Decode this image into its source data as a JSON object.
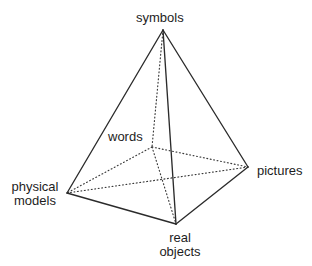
{
  "figure": {
    "background_color": "#ffffff",
    "line_color": "#2b2b2b",
    "text_color": "#1d1d1d",
    "width": 312,
    "height": 266
  },
  "vertices": {
    "symbols": {
      "label": "symbols",
      "x": 163,
      "y": 30,
      "hidden": false
    },
    "words": {
      "label": "words",
      "x": 152,
      "y": 147,
      "hidden": true
    },
    "pictures": {
      "label": "pictures",
      "x": 248,
      "y": 167,
      "hidden": false
    },
    "physical_models": {
      "label_line1": "physical",
      "label_line2": "models",
      "x": 67,
      "y": 193,
      "hidden": false
    },
    "real_objects": {
      "label_line1": "real",
      "label_line2": "objects",
      "x": 176,
      "y": 224,
      "hidden": false
    }
  },
  "edges": [
    {
      "from": "symbols",
      "to": "physical_models",
      "style": "solid"
    },
    {
      "from": "symbols",
      "to": "pictures",
      "style": "solid"
    },
    {
      "from": "symbols",
      "to": "real_objects",
      "style": "solid"
    },
    {
      "from": "physical_models",
      "to": "real_objects",
      "style": "solid"
    },
    {
      "from": "real_objects",
      "to": "pictures",
      "style": "solid"
    },
    {
      "from": "symbols",
      "to": "words",
      "style": "dotted"
    },
    {
      "from": "words",
      "to": "physical_models",
      "style": "dotted"
    },
    {
      "from": "words",
      "to": "pictures",
      "style": "dotted"
    },
    {
      "from": "words",
      "to": "real_objects",
      "style": "dotted"
    },
    {
      "from": "physical_models",
      "to": "pictures",
      "style": "dotted"
    }
  ]
}
